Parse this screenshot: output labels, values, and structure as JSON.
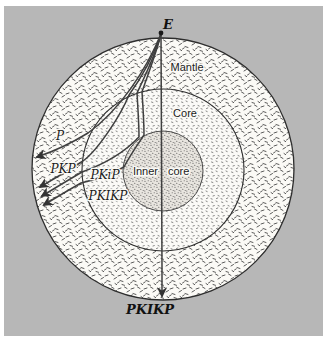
{
  "diagram": {
    "source_point_label": "E",
    "layers": {
      "mantle": "Mantle",
      "core": "Core",
      "inner_core_word1": "Inner",
      "inner_core_word2": "core"
    },
    "rays": {
      "p": "P",
      "pkp": "PKP",
      "pkip": "PKiP",
      "pkikp": "PKIKP",
      "pkikp_antipode": "PKIKP"
    },
    "colors": {
      "page_margin": "#ffffff",
      "background": "#b7b7b7",
      "mantle_fill": "#fbfaf6",
      "core_fill": "#fbfaf7",
      "inner_core_fill": "#e8e5df",
      "line": "#2d2d2d",
      "ray": "#3f3f3f",
      "text": "#1c1c1c"
    }
  }
}
